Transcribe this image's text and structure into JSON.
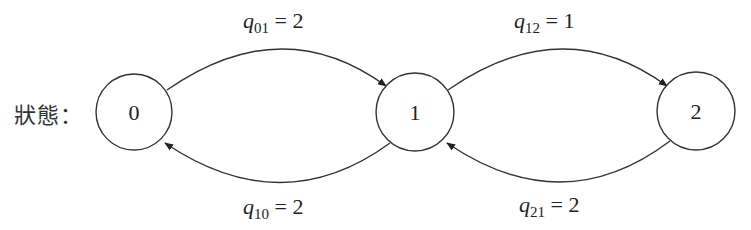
{
  "label": "狀態：",
  "states": [
    {
      "id": "0",
      "label": "0",
      "cx": 134,
      "cy": 112,
      "r": 38
    },
    {
      "id": "1",
      "label": "1",
      "cx": 415,
      "cy": 112,
      "r": 39
    },
    {
      "id": "2",
      "label": "2",
      "cx": 696,
      "cy": 111,
      "r": 39
    }
  ],
  "transitions": [
    {
      "from": "0",
      "to": "1",
      "symbol": "q",
      "subscript": "01",
      "equals": "=",
      "value": "2",
      "position": "top"
    },
    {
      "from": "1",
      "to": "0",
      "symbol": "q",
      "subscript": "10",
      "equals": "=",
      "value": "2",
      "position": "bottom"
    },
    {
      "from": "1",
      "to": "2",
      "symbol": "q",
      "subscript": "12",
      "equals": "=",
      "value": "1",
      "position": "top"
    },
    {
      "from": "2",
      "to": "1",
      "symbol": "q",
      "subscript": "21",
      "equals": "=",
      "value": "2",
      "position": "bottom"
    }
  ],
  "colors": {
    "stroke": "#333333",
    "text": "#222222",
    "background": "#ffffff"
  }
}
